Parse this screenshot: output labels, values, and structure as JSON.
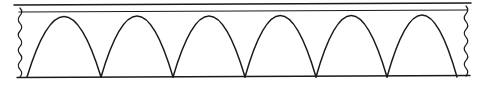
{
  "figure": {
    "caption": "",
    "background_color": "#ffffff",
    "ink_color": "#1a1a1a"
  },
  "geometry": {
    "canvas": {
      "width": 485,
      "height": 85
    },
    "deck": {
      "name": "deck-band",
      "top_line": {
        "x1": 14,
        "y1": 5.0,
        "x2": 471,
        "y2": 3.0
      },
      "bottom_line": {
        "x1": 19,
        "y1": 12.0,
        "x2": 467,
        "y2": 10.0
      }
    },
    "base": {
      "name": "base-line",
      "x1": 17,
      "y1": 77.5,
      "x2": 470,
      "y2": 75.5
    },
    "arches": {
      "count": 6,
      "springing_y": 77,
      "crown_y": 16,
      "label": "parabolic arch",
      "spans": [
        {
          "index": 1,
          "left_x": 27,
          "right_x": 101,
          "crown_x": 64,
          "crown_y": 16.5
        },
        {
          "index": 2,
          "left_x": 101,
          "right_x": 173,
          "crown_x": 137,
          "crown_y": 16.0
        },
        {
          "index": 3,
          "left_x": 173,
          "right_x": 245,
          "crown_x": 209,
          "crown_y": 16.0
        },
        {
          "index": 4,
          "left_x": 245,
          "right_x": 316,
          "crown_x": 280,
          "crown_y": 15.5
        },
        {
          "index": 5,
          "left_x": 316,
          "right_x": 387,
          "crown_x": 351,
          "crown_y": 15.5
        },
        {
          "index": 6,
          "left_x": 387,
          "right_x": 457,
          "crown_x": 422,
          "crown_y": 15.0
        }
      ]
    },
    "break_marks": [
      {
        "name": "left-break",
        "x": 20,
        "y_top": 8,
        "y_bottom": 77,
        "amplitude": 3.5,
        "waves": 9
      },
      {
        "name": "right-break",
        "x": 466,
        "y_top": 6,
        "y_bottom": 76,
        "amplitude": 3.5,
        "waves": 9
      }
    ]
  },
  "chart_data": {
    "type": "line",
    "xlabel": "",
    "ylabel": "",
    "grid": false,
    "legend": "none",
    "xlim": [
      0,
      485
    ],
    "ylim": [
      85,
      0
    ],
    "series": [
      {
        "name": "deck-top-edge",
        "x": [
          14,
          471
        ],
        "values": [
          5.0,
          3.0
        ]
      },
      {
        "name": "deck-bottom-edge",
        "x": [
          19,
          467
        ],
        "values": [
          12.0,
          10.0
        ]
      },
      {
        "name": "base-line",
        "x": [
          17,
          470
        ],
        "values": [
          77.5,
          75.5
        ]
      },
      {
        "name": "arch-1",
        "x": [
          27,
          64,
          101
        ],
        "values": [
          77,
          16.5,
          77
        ]
      },
      {
        "name": "arch-2",
        "x": [
          101,
          137,
          173
        ],
        "values": [
          77,
          16.0,
          77
        ]
      },
      {
        "name": "arch-3",
        "x": [
          173,
          209,
          245
        ],
        "values": [
          77,
          16.0,
          77
        ]
      },
      {
        "name": "arch-4",
        "x": [
          245,
          280,
          316
        ],
        "values": [
          77,
          15.5,
          77
        ]
      },
      {
        "name": "arch-5",
        "x": [
          316,
          351,
          387
        ],
        "values": [
          77,
          15.5,
          77
        ]
      },
      {
        "name": "arch-6",
        "x": [
          387,
          422,
          457
        ],
        "values": [
          77,
          15.0,
          77
        ]
      }
    ]
  }
}
